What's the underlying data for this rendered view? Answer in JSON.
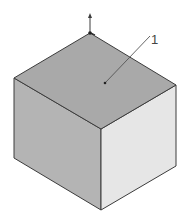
{
  "figure": {
    "type": "isometric-cube",
    "colors": {
      "background": "#ffffff",
      "top_face": "#a9a9a9",
      "left_face": "#b4b4b4",
      "right_face": "#e6e6e6",
      "edge": "#3c3c3c",
      "leader": "#555555"
    },
    "annotation": {
      "label": "1",
      "target": "top-face"
    },
    "axis_arrow": {
      "direction": "up"
    }
  }
}
